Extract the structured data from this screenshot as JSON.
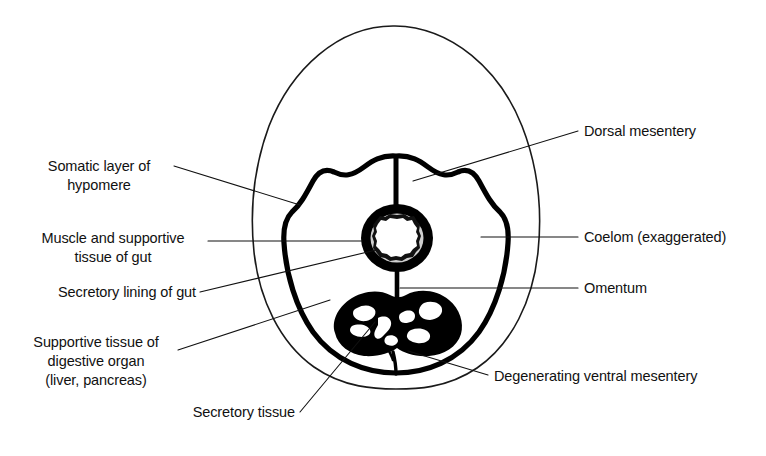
{
  "figure": {
    "background_color": "#ffffff",
    "ink_color": "#111111",
    "hatch_color": "#4a4a4a",
    "body_wall_fill": "#d8d8d8"
  },
  "labels": {
    "somatic_layer": "Somatic layer of",
    "somatic_layer_2": "hypomere",
    "muscle_gut": "Muscle and supportive",
    "muscle_gut_2": "tissue of gut",
    "secretory_lining": "Secretory lining of gut",
    "supportive_organ": "Supportive tissue of",
    "supportive_organ_2": "digestive organ",
    "supportive_organ_3": "(liver, pancreas)",
    "secretory_tissue": "Secretory tissue",
    "dorsal_mesentery": "Dorsal mesentery",
    "coelom": "Coelom (exaggerated)",
    "omentum": "Omentum",
    "ventral_mesentery": "Degenerating ventral mesentery"
  },
  "structures": {
    "body_wall": "hypomere-body-wall",
    "coelom_cavity": "coelom-cavity",
    "gut_ring": "gut-cross-section",
    "gut_lumen": "gut-lumen",
    "digestive_organ": "liver-pancreas-mass",
    "dorsal_stalk": "dorsal-mesentery-stalk",
    "omentum_stalk": "omentum-stalk",
    "ventral_spike": "degenerating-ventral-mesentery"
  }
}
